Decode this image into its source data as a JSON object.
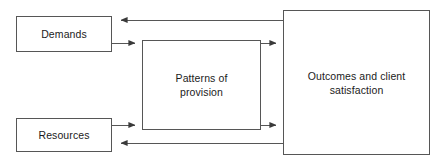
{
  "diagram": {
    "type": "flow-diagram",
    "background_color": "#ffffff",
    "line_color": "#565656",
    "text_color": "#1b1b1b",
    "nodes": [
      {
        "id": "demands",
        "label": "Demands",
        "x": 16,
        "y": 16,
        "width": 96,
        "height": 36
      },
      {
        "id": "resources",
        "label": "Resources",
        "x": 16,
        "y": 118,
        "width": 96,
        "height": 34
      },
      {
        "id": "patterns",
        "label": "Patterns of\nprovision",
        "x": 142,
        "y": 40,
        "width": 119,
        "height": 90
      },
      {
        "id": "outcomes",
        "label": "Outcomes and client\nsatisfaction",
        "x": 283,
        "y": 10,
        "width": 147,
        "height": 145
      }
    ],
    "edges": [
      {
        "id": "demands-to-patterns",
        "from": "demands",
        "to": "patterns",
        "label": "",
        "arrow": "end"
      },
      {
        "id": "resources-to-patterns",
        "from": "resources",
        "to": "patterns",
        "label": "",
        "arrow": "end"
      },
      {
        "id": "patterns-to-outcomes-top",
        "from": "patterns",
        "to": "outcomes",
        "label": "",
        "arrow": "end"
      },
      {
        "id": "patterns-to-outcomes-bottom",
        "from": "patterns",
        "to": "outcomes",
        "label": "",
        "arrow": "end"
      },
      {
        "id": "outcomes-to-demands",
        "from": "outcomes",
        "to": "demands",
        "label": "",
        "arrow": "end"
      },
      {
        "id": "outcomes-to-resources",
        "from": "outcomes",
        "to": "resources",
        "label": "",
        "arrow": "end"
      }
    ]
  }
}
